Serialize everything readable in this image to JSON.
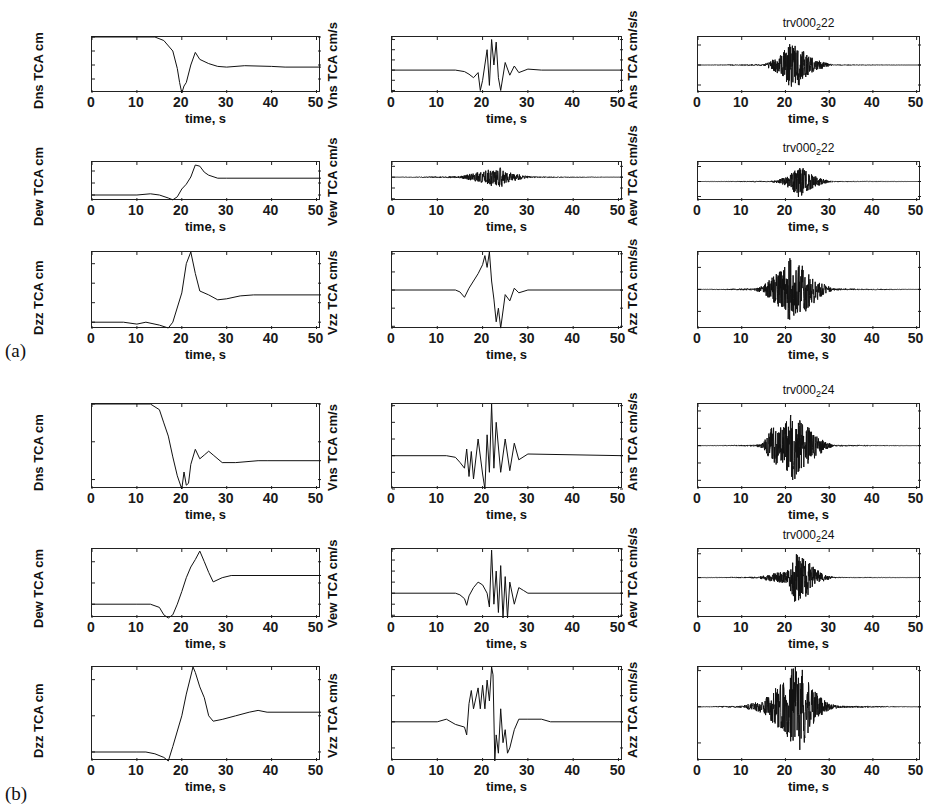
{
  "figure": {
    "section_labels": [
      "(a)",
      "(b)"
    ],
    "xlabel": "time, s",
    "x_ticks": [
      "0",
      "10",
      "20",
      "30",
      "40",
      "50"
    ]
  },
  "chart_data": [
    {
      "type": "line",
      "section": "(a)",
      "title": "",
      "ylabel": "Dns TCA cm",
      "xlabel": "time, s",
      "xlim": [
        0,
        51
      ],
      "ylim": [
        -80,
        0
      ],
      "y_ticks": [
        "0",
        "-20",
        "-40",
        "-60"
      ],
      "x_ticks": [
        "0",
        "10",
        "20",
        "30",
        "40",
        "50"
      ],
      "x": [
        0,
        14,
        16,
        18,
        19,
        19.5,
        20,
        20.5,
        21,
        22,
        23,
        24,
        26,
        28,
        30,
        34,
        40,
        43,
        51
      ],
      "values": [
        0,
        0,
        -5,
        -20,
        -45,
        -65,
        -80,
        -70,
        -65,
        -40,
        -22,
        -32,
        -38,
        -42,
        -43,
        -41,
        -42,
        -43,
        -43
      ]
    },
    {
      "type": "line",
      "section": "(a)",
      "title": "",
      "ylabel": "Vns TCA cm/s",
      "xlabel": "time, s",
      "xlim": [
        0,
        51
      ],
      "ylim": [
        -45,
        65
      ],
      "y_ticks": [
        "60",
        "40",
        "20",
        "0",
        "-20",
        "-40"
      ],
      "x_ticks": [
        "0",
        "10",
        "20",
        "30",
        "40",
        "50"
      ],
      "x": [
        0,
        14,
        16,
        17,
        18,
        19,
        19.5,
        20,
        21,
        21.5,
        22,
        22.5,
        23,
        23.5,
        24,
        25,
        26,
        27,
        28,
        30,
        33,
        51
      ],
      "values": [
        0,
        0,
        -3,
        -8,
        -15,
        -5,
        -40,
        -20,
        40,
        -30,
        60,
        10,
        55,
        -15,
        -40,
        15,
        -10,
        8,
        -5,
        2,
        0,
        0
      ]
    },
    {
      "type": "line",
      "section": "(a)",
      "title": "trv000_2 22",
      "ylabel": "Ans TCA cm/s/s",
      "xlabel": "time, s",
      "xlim": [
        0,
        51
      ],
      "ylim": [
        -700,
        700
      ],
      "y_ticks": [
        "500",
        "0",
        "-500"
      ],
      "x_ticks": [
        "0",
        "10",
        "20",
        "30",
        "40",
        "50"
      ],
      "envelope_x": [
        0,
        15,
        17,
        19,
        20,
        21,
        22,
        23,
        24,
        25,
        27,
        29,
        31,
        51
      ],
      "envelope_amp": [
        0,
        20,
        150,
        300,
        450,
        700,
        500,
        650,
        400,
        300,
        150,
        80,
        10,
        0
      ]
    },
    {
      "type": "line",
      "section": "(a)",
      "title": "",
      "ylabel": "Dew TCA cm",
      "xlabel": "time, s",
      "xlim": [
        0,
        51
      ],
      "ylim": [
        -10,
        55
      ],
      "y_ticks": [
        "40",
        "20",
        "0"
      ],
      "x_ticks": [
        "0",
        "10",
        "20",
        "30",
        "40",
        "50"
      ],
      "x": [
        0,
        10,
        13,
        15,
        17,
        18,
        19,
        20,
        21,
        22,
        23,
        24,
        25,
        26,
        28,
        30,
        51
      ],
      "values": [
        0,
        0,
        2,
        0,
        -5,
        -8,
        -3,
        10,
        18,
        30,
        50,
        48,
        38,
        33,
        28,
        28,
        28
      ]
    },
    {
      "type": "line",
      "section": "(a)",
      "title": "",
      "ylabel": "Vew TCA cm/s",
      "xlabel": "time, s",
      "xlim": [
        0,
        51
      ],
      "ylim": [
        -110,
        70
      ],
      "y_ticks": [
        "50",
        "0",
        "-50",
        "-100"
      ],
      "x_ticks": [
        "0",
        "10",
        "20",
        "30",
        "40",
        "50"
      ],
      "envelope_x": [
        0,
        15,
        17,
        19,
        21,
        22,
        23,
        24,
        25,
        27,
        29,
        31,
        51
      ],
      "envelope_amp": [
        0,
        5,
        15,
        25,
        35,
        65,
        40,
        60,
        30,
        20,
        10,
        3,
        0
      ]
    },
    {
      "type": "line",
      "section": "(a)",
      "title": "trv000_2 22",
      "ylabel": "Aew TCA cm/s/s",
      "xlabel": "time, s",
      "xlim": [
        0,
        51
      ],
      "ylim": [
        -1300,
        1300
      ],
      "y_ticks": [
        "1000",
        "0",
        "-1000"
      ],
      "x_ticks": [
        "0",
        "10",
        "20",
        "30",
        "40",
        "50"
      ],
      "envelope_x": [
        0,
        17,
        19,
        21,
        22,
        23,
        24,
        25,
        27,
        29,
        31,
        51
      ],
      "envelope_amp": [
        0,
        50,
        200,
        500,
        900,
        1200,
        1000,
        700,
        400,
        150,
        30,
        0
      ]
    },
    {
      "type": "line",
      "section": "(a)",
      "title": "",
      "ylabel": "Dzz TCA cm",
      "xlabel": "time, s",
      "xlim": [
        0,
        51
      ],
      "ylim": [
        -7,
        72
      ],
      "y_ticks": [
        "60",
        "40",
        "20",
        "0"
      ],
      "x_ticks": [
        "0",
        "10",
        "20",
        "30",
        "40",
        "50"
      ],
      "x": [
        0,
        7,
        10,
        12,
        15,
        17,
        18,
        20,
        21,
        22,
        23,
        24,
        26,
        28,
        30,
        33,
        36,
        51
      ],
      "values": [
        0,
        0,
        -2,
        0,
        -3,
        -6,
        0,
        30,
        60,
        72,
        50,
        32,
        28,
        23,
        24,
        27,
        28,
        28
      ]
    },
    {
      "type": "line",
      "section": "(a)",
      "title": "",
      "ylabel": "Vzz TCA cm/s",
      "xlabel": "time, s",
      "xlim": [
        0,
        51
      ],
      "ylim": [
        -43,
        42
      ],
      "y_ticks": [
        "40",
        "20",
        "0",
        "-20",
        "-40"
      ],
      "x_ticks": [
        "0",
        "10",
        "20",
        "30",
        "40",
        "50"
      ],
      "x": [
        0,
        14,
        15,
        16,
        17,
        18,
        19,
        20,
        20.5,
        21,
        21.5,
        22,
        22.5,
        23,
        23.5,
        24,
        25,
        26,
        27,
        28,
        30,
        51
      ],
      "values": [
        0,
        0,
        -2,
        -8,
        2,
        10,
        18,
        28,
        38,
        25,
        42,
        10,
        -10,
        -35,
        -20,
        -42,
        -5,
        -12,
        2,
        -3,
        0,
        0
      ]
    },
    {
      "type": "line",
      "section": "(a)",
      "title": "",
      "ylabel": "Azz TCA cm/s/s",
      "xlabel": "time, s",
      "xlim": [
        0,
        51
      ],
      "ylim": [
        -180,
        170
      ],
      "y_ticks": [
        "100",
        "0",
        "-100"
      ],
      "x_ticks": [
        "0",
        "10",
        "20",
        "30",
        "40",
        "50"
      ],
      "envelope_x": [
        0,
        13,
        15,
        17,
        19,
        20,
        21,
        22,
        23,
        24,
        25,
        27,
        29,
        31,
        51
      ],
      "envelope_amp": [
        0,
        5,
        25,
        60,
        100,
        120,
        170,
        160,
        120,
        140,
        100,
        60,
        25,
        5,
        0
      ]
    },
    {
      "type": "line",
      "section": "(b)",
      "title": "",
      "ylabel": "Dns TCA cm",
      "xlabel": "time, s",
      "xlim": [
        0,
        51
      ],
      "ylim": [
        -45,
        0
      ],
      "y_ticks": [
        "0",
        "-20",
        "-40"
      ],
      "x_ticks": [
        "0",
        "10",
        "20",
        "30",
        "40",
        "50"
      ],
      "x": [
        0,
        13,
        15,
        16,
        17,
        18,
        19,
        20,
        20.5,
        21,
        21.5,
        22,
        23,
        24,
        25,
        26,
        27,
        29,
        32,
        37,
        39,
        51
      ],
      "values": [
        0,
        0,
        -3,
        -10,
        -17,
        -28,
        -38,
        -45,
        -36,
        -43,
        -42,
        -32,
        -24,
        -29,
        -27,
        -25,
        -27,
        -31,
        -31,
        -30,
        -30,
        -30
      ]
    },
    {
      "type": "line",
      "section": "(b)",
      "title": "",
      "ylabel": "Vns TCA cm/s",
      "xlabel": "time, s",
      "xlim": [
        0,
        51
      ],
      "ylim": [
        -40,
        62
      ],
      "y_ticks": [
        "60",
        "40",
        "20",
        "0",
        "-20",
        "-40"
      ],
      "x_ticks": [
        "0",
        "10",
        "20",
        "30",
        "40",
        "50"
      ],
      "x": [
        0,
        12,
        14,
        15,
        16,
        16.5,
        17,
        17.5,
        18,
        19,
        20,
        20.5,
        21,
        21.5,
        22,
        22.5,
        23,
        24,
        25,
        26,
        27,
        28,
        30,
        51
      ],
      "values": [
        0,
        0,
        -2,
        -8,
        -15,
        8,
        -25,
        5,
        -28,
        20,
        -22,
        -40,
        25,
        -20,
        62,
        -15,
        40,
        -20,
        20,
        -18,
        15,
        -5,
        2,
        0
      ]
    },
    {
      "type": "line",
      "section": "(b)",
      "title": "trv000_2 24",
      "ylabel": "Ans TCA cm/s/s",
      "xlabel": "time, s",
      "xlim": [
        0,
        51
      ],
      "ylim": [
        -500,
        480
      ],
      "y_ticks": [
        "400",
        "200",
        "0",
        "-200",
        "-400"
      ],
      "x_ticks": [
        "0",
        "10",
        "20",
        "30",
        "40",
        "50"
      ],
      "envelope_x": [
        0,
        13,
        15,
        16,
        17,
        19,
        20,
        21,
        22,
        23,
        24,
        25,
        27,
        29,
        31,
        51
      ],
      "envelope_amp": [
        0,
        10,
        40,
        150,
        250,
        250,
        300,
        400,
        480,
        350,
        300,
        250,
        150,
        60,
        10,
        0
      ]
    },
    {
      "type": "line",
      "section": "(b)",
      "title": "",
      "ylabel": "Dew TCA cm",
      "xlabel": "time, s",
      "xlim": [
        0,
        51
      ],
      "ylim": [
        -13,
        52
      ],
      "y_ticks": [
        "40",
        "20",
        "0"
      ],
      "x_ticks": [
        "0",
        "10",
        "20",
        "30",
        "40",
        "50"
      ],
      "x": [
        0,
        10,
        13,
        15,
        16,
        17,
        18,
        19,
        20,
        21,
        22,
        23,
        24,
        25,
        26,
        27,
        29,
        31,
        51
      ],
      "values": [
        0,
        0,
        0,
        -3,
        -10,
        -13,
        -10,
        0,
        12,
        25,
        35,
        42,
        50,
        40,
        30,
        21,
        25,
        27,
        27
      ]
    },
    {
      "type": "line",
      "section": "(b)",
      "title": "",
      "ylabel": "Vew TCA cm/s",
      "xlabel": "time, s",
      "xlim": [
        0,
        51
      ],
      "ylim": [
        -45,
        80
      ],
      "y_ticks": [
        "80",
        "60",
        "40",
        "20",
        "0",
        "-20",
        "-40"
      ],
      "x_ticks": [
        "0",
        "10",
        "20",
        "30",
        "40",
        "50"
      ],
      "x": [
        0,
        14,
        15,
        16,
        16.5,
        17,
        18,
        19,
        20,
        21,
        21.5,
        22,
        22.5,
        23,
        23.5,
        24,
        24.5,
        25,
        25.5,
        26,
        27,
        28,
        29,
        30,
        51
      ],
      "values": [
        0,
        0,
        -3,
        -10,
        -22,
        -5,
        10,
        20,
        15,
        0,
        -25,
        78,
        -20,
        40,
        -35,
        50,
        -45,
        30,
        -45,
        20,
        -20,
        10,
        5,
        0,
        0
      ]
    },
    {
      "type": "line",
      "section": "(b)",
      "title": "trv000_2 24",
      "ylabel": "Aew TCA cm/s/s",
      "xlabel": "time, s",
      "xlim": [
        0,
        51
      ],
      "ylim": [
        -850,
        600
      ],
      "y_ticks": [
        "500",
        "0",
        "-500"
      ],
      "x_ticks": [
        "0",
        "10",
        "20",
        "30",
        "40",
        "50"
      ],
      "envelope_x": [
        0,
        14,
        16,
        18,
        20,
        21,
        22,
        23,
        24,
        25,
        26,
        28,
        30,
        32,
        51
      ],
      "envelope_amp": [
        0,
        20,
        80,
        120,
        150,
        250,
        600,
        550,
        500,
        450,
        300,
        120,
        40,
        10,
        0
      ]
    },
    {
      "type": "line",
      "section": "(b)",
      "title": "",
      "ylabel": "Dzz TCA cm",
      "xlabel": "time, s",
      "xlim": [
        0,
        51
      ],
      "ylim": [
        -5,
        47
      ],
      "y_ticks": [
        "40",
        "20",
        "0"
      ],
      "x_ticks": [
        "0",
        "10",
        "20",
        "30",
        "40",
        "50"
      ],
      "x": [
        0,
        10,
        12,
        14,
        16,
        17,
        18,
        20,
        21,
        22,
        22.5,
        23,
        24,
        25,
        26,
        27,
        29,
        32,
        35,
        37,
        39,
        51
      ],
      "values": [
        0,
        0,
        0,
        -1,
        -3,
        -5,
        3,
        20,
        32,
        42,
        47,
        44,
        36,
        30,
        20,
        17,
        18,
        20,
        22,
        23,
        22,
        22
      ]
    },
    {
      "type": "line",
      "section": "(b)",
      "title": "",
      "ylabel": "Vzz TCA cm/s",
      "xlabel": "time, s",
      "xlim": [
        0,
        51
      ],
      "ylim": [
        -15,
        21
      ],
      "y_ticks": [
        "20",
        "10",
        "0",
        "-10"
      ],
      "x_ticks": [
        "0",
        "10",
        "20",
        "30",
        "40",
        "50"
      ],
      "x": [
        0,
        10,
        12,
        14,
        16,
        16.5,
        17,
        17.5,
        18,
        19,
        19.5,
        20,
        20.5,
        21,
        21.5,
        22,
        22.3,
        22.7,
        23,
        23.5,
        24,
        24.5,
        25,
        25.5,
        26,
        27,
        28,
        30,
        33,
        35,
        51
      ],
      "values": [
        0,
        0,
        1,
        -1,
        -2,
        -5,
        7,
        12,
        5,
        13,
        5,
        14,
        5,
        16,
        8,
        21,
        18,
        -15,
        -5,
        -12,
        5,
        -8,
        -3,
        -12,
        -10,
        -3,
        1,
        1,
        1,
        0,
        0
      ]
    },
    {
      "type": "line",
      "section": "(b)",
      "title": "",
      "ylabel": "Azz TCA cm/s/s",
      "xlabel": "time, s",
      "xlim": [
        0,
        51
      ],
      "ylim": [
        -150,
        110
      ],
      "y_ticks": [
        "100",
        "0",
        "-100"
      ],
      "x_ticks": [
        "0",
        "10",
        "20",
        "30",
        "40",
        "50"
      ],
      "envelope_x": [
        0,
        10,
        12,
        15,
        17,
        19,
        20,
        21,
        22,
        23,
        24,
        25,
        26,
        28,
        30,
        33,
        51
      ],
      "envelope_amp": [
        0,
        3,
        10,
        20,
        50,
        75,
        80,
        110,
        130,
        150,
        120,
        90,
        60,
        30,
        10,
        3,
        0
      ]
    }
  ]
}
